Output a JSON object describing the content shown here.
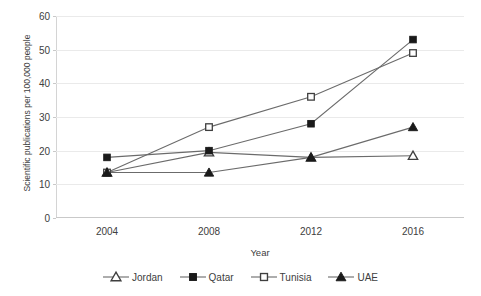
{
  "chart_data": {
    "type": "line",
    "title": "",
    "xlabel": "Year",
    "ylabel": "Scientific publications per 100,000 people",
    "categories": [
      "2004",
      "2008",
      "2012",
      "2016"
    ],
    "x": [
      2004,
      2008,
      2012,
      2016
    ],
    "ylim": [
      0,
      60
    ],
    "yticks": [
      0,
      10,
      20,
      30,
      40,
      50,
      60
    ],
    "ytick_labels": [
      "0",
      "10",
      "20",
      "30",
      "40",
      "50",
      "60"
    ],
    "grid": true,
    "legend_position": "bottom",
    "series": [
      {
        "name": "Jordan",
        "marker": "open-triangle",
        "color": "#3f3f3f",
        "values": [
          13.5,
          19.5,
          18.0,
          18.5
        ]
      },
      {
        "name": "Qatar",
        "marker": "filled-square",
        "color": "#1a1a1a",
        "values": [
          18.0,
          20.0,
          28.0,
          53.0
        ]
      },
      {
        "name": "Tunisia",
        "marker": "open-square",
        "color": "#3f3f3f",
        "values": [
          13.5,
          27.0,
          36.0,
          49.0
        ]
      },
      {
        "name": "UAE",
        "marker": "filled-triangle",
        "color": "#1a1a1a",
        "values": [
          13.5,
          13.5,
          18.0,
          27.0
        ]
      }
    ]
  }
}
